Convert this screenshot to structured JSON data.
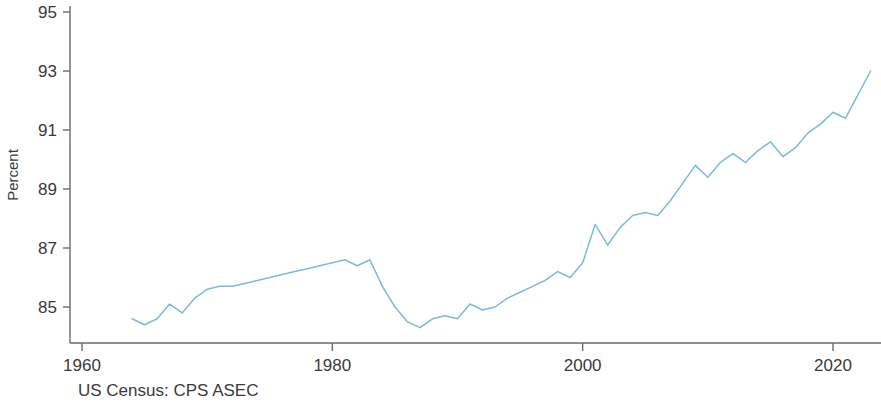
{
  "chart_data": {
    "type": "line",
    "title": "",
    "subtitle": "",
    "xlabel": "",
    "ylabel": "Percent",
    "source": "US Census: CPS ASEC",
    "grid": false,
    "legend": null,
    "xlim": [
      1960,
      2024
    ],
    "ylim": [
      83.8,
      95.6
    ],
    "xticks": [
      1960,
      1980,
      2000,
      2020
    ],
    "xtick_labels": [
      "1960",
      "1980",
      "2000",
      "2020"
    ],
    "yticks": [
      85,
      87,
      89,
      91,
      93,
      95
    ],
    "ytick_labels": [
      "85",
      "87",
      "89",
      "91",
      "93",
      "95"
    ],
    "line_color": "#7cb9e0",
    "axis_color": "#6b6b6b",
    "series": [
      {
        "name": "Percent",
        "x": [
          1964,
          1965,
          1966,
          1967,
          1968,
          1969,
          1970,
          1971,
          1972,
          1973,
          1974,
          1975,
          1976,
          1977,
          1978,
          1979,
          1980,
          1981,
          1982,
          1983,
          1984,
          1985,
          1986,
          1987,
          1988,
          1989,
          1990,
          1991,
          1992,
          1993,
          1994,
          1995,
          1996,
          1997,
          1998,
          1999,
          2000,
          2001,
          2002,
          2003,
          2004,
          2005,
          2006,
          2007,
          2008,
          2009,
          2010,
          2011,
          2012,
          2013,
          2014,
          2015,
          2016,
          2017,
          2018,
          2019,
          2020,
          2021,
          2022,
          2023
        ],
        "values": [
          84.6,
          84.4,
          84.6,
          85.1,
          84.8,
          85.3,
          85.6,
          85.7,
          85.7,
          85.8,
          85.9,
          86.0,
          86.1,
          86.2,
          86.3,
          86.4,
          86.5,
          86.6,
          86.4,
          86.6,
          85.7,
          85.0,
          84.5,
          84.3,
          84.6,
          84.7,
          84.6,
          85.1,
          84.9,
          85.0,
          85.3,
          85.5,
          85.7,
          85.9,
          86.2,
          86.0,
          86.5,
          87.8,
          87.1,
          87.7,
          88.1,
          88.2,
          88.1,
          88.6,
          89.2,
          89.8,
          89.4,
          89.9,
          90.2,
          89.9,
          90.3,
          90.6,
          90.1,
          90.4,
          90.9,
          91.2,
          91.6,
          91.4,
          92.2,
          93.0
        ]
      }
    ]
  },
  "axes": {
    "y_axis_title": "Percent",
    "source_caption": "US Census: CPS ASEC"
  }
}
